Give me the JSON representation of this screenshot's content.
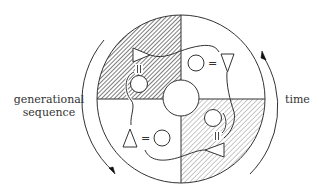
{
  "labels": {
    "left_line1": "generational",
    "left_line2": "sequence",
    "right": "time"
  },
  "symbols": {
    "equals": "=",
    "equals_rotated": "="
  },
  "colors": {
    "stroke": "#333333",
    "hatch_dark": "#444444",
    "hatch_light": "#9a9a9a",
    "background": "#ffffff"
  },
  "quadrants": [
    {
      "position": "top-left",
      "hatch": "dark",
      "content": "triangle-right = circle (vertical)"
    },
    {
      "position": "top-right",
      "hatch": "none",
      "content": "circle = triangle-down"
    },
    {
      "position": "bottom-left",
      "hatch": "none",
      "content": "triangle-up = circle"
    },
    {
      "position": "bottom-right",
      "hatch": "light",
      "content": "circle = triangle-left (vertical)"
    }
  ]
}
